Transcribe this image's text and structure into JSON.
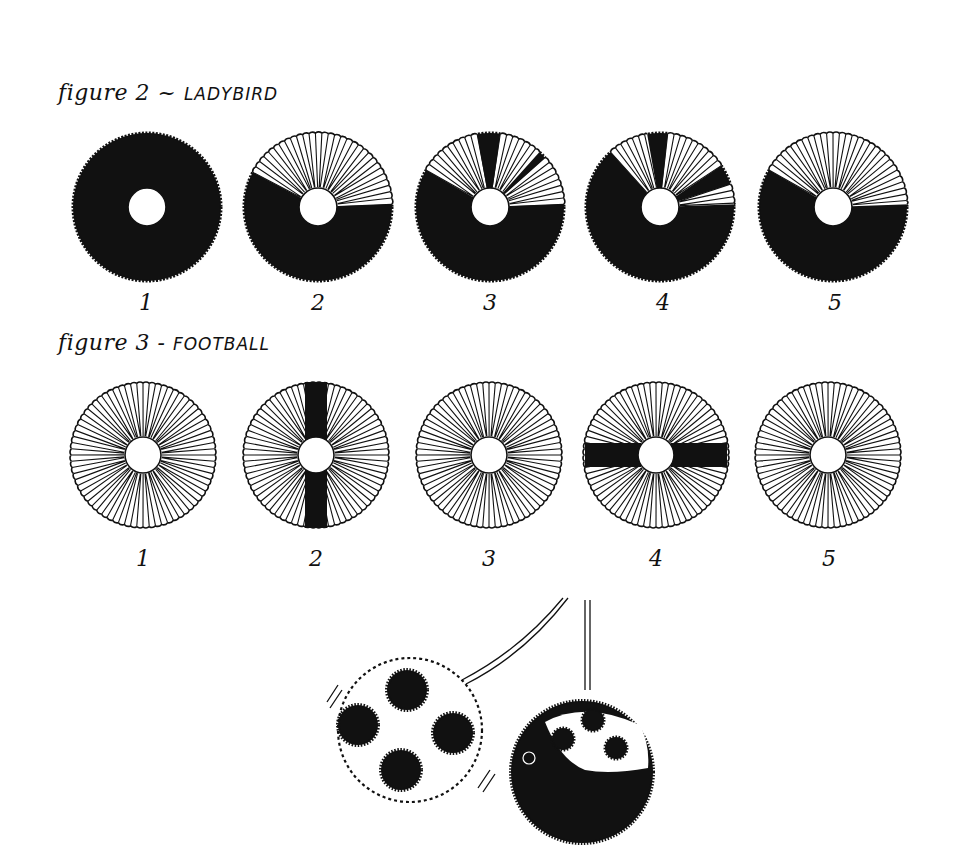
{
  "figure2": {
    "title_prefix": "figure 2 ~",
    "title_name": "LADYBIRD",
    "steps": [
      {
        "label": "1",
        "cx": 147,
        "cy": 207
      },
      {
        "label": "2",
        "cx": 318,
        "cy": 207
      },
      {
        "label": "3",
        "cx": 490,
        "cy": 207
      },
      {
        "label": "4",
        "cx": 660,
        "cy": 207
      },
      {
        "label": "5",
        "cx": 833,
        "cy": 207
      }
    ]
  },
  "figure3": {
    "title_prefix": "figure 3 -",
    "title_name": "FOOTBALL",
    "steps": [
      {
        "label": "1",
        "cx": 143,
        "cy": 455
      },
      {
        "label": "2",
        "cx": 316,
        "cy": 455
      },
      {
        "label": "3",
        "cx": 489,
        "cy": 455
      },
      {
        "label": "4",
        "cx": 656,
        "cy": 455
      },
      {
        "label": "5",
        "cx": 828,
        "cy": 455
      }
    ]
  },
  "illustration": {
    "description": "finished pompoms: football and ladybird hanging on strings"
  },
  "colors": {
    "ink": "#111111",
    "paper": "#ffffff"
  }
}
